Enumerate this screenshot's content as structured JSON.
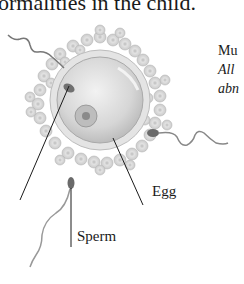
{
  "header": {
    "partial_text": "ormalities in the child."
  },
  "side_note": {
    "line1": "Mu",
    "line2": "All",
    "line3": "abn"
  },
  "labels": {
    "egg": "Egg",
    "sperm": "Sperm"
  },
  "colors": {
    "egg_fill": "#dcdcdc",
    "cells": "#cfcfcf",
    "line": "#1a1a1a",
    "nucleus": "#a8a8a8"
  }
}
